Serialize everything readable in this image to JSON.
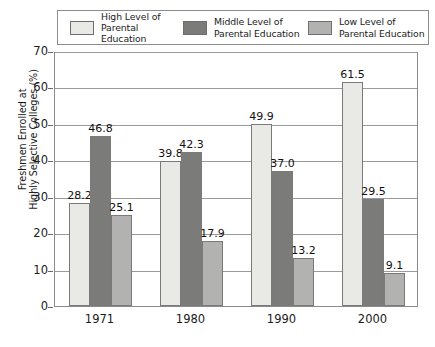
{
  "chart_data": {
    "type": "bar",
    "title": "",
    "xlabel": "",
    "ylabel": "Freshmen Enrolled at\nHighly Selective Colleges (%)",
    "categories": [
      "1971",
      "1980",
      "1990",
      "2000"
    ],
    "ylim": [
      0,
      70
    ],
    "yticks": [
      0,
      10,
      20,
      30,
      40,
      50,
      60,
      70
    ],
    "ytick_labels": [
      "0",
      "10",
      "20",
      "30",
      "40",
      "50",
      "60",
      "70"
    ],
    "grid": true,
    "legend_position": "top",
    "series": [
      {
        "name": "High Level of\nParental Education",
        "color": "#e9e9e6",
        "values": [
          28.2,
          39.8,
          49.9,
          61.5
        ],
        "labels": [
          "28.2",
          "39.8",
          "49.9",
          "61.5"
        ]
      },
      {
        "name": "Middle Level of\nParental Education",
        "color": "#7b7b79",
        "values": [
          46.8,
          42.3,
          37.0,
          29.5
        ],
        "labels": [
          "46.8",
          "42.3",
          "37.0",
          "29.5"
        ]
      },
      {
        "name": "Low Level of\nParental Education",
        "color": "#b2b2b0",
        "values": [
          25.1,
          17.9,
          13.2,
          9.1
        ],
        "labels": [
          "25.1",
          "17.9",
          "13.2",
          "9.1"
        ]
      }
    ]
  },
  "caption": ""
}
